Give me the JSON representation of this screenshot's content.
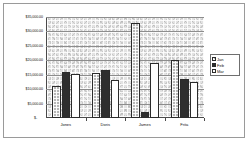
{
  "chart_data": {
    "type": "bar",
    "title": "",
    "xlabel": "",
    "ylabel": "",
    "ylim": [
      0,
      35000
    ],
    "grid": true,
    "legend_position": "right",
    "categories": [
      "Jones",
      "Doris",
      "James",
      "Frita"
    ],
    "ytick_labels": [
      "$35,000.00",
      "$30,000.00",
      "$25,000.00",
      "$20,000.00",
      "$15,000.00",
      "$10,000.00",
      "$5,000.00"
    ],
    "ytick_values": [
      35000,
      30000,
      25000,
      20000,
      15000,
      10000,
      5000
    ],
    "zero_label": "$-",
    "series": [
      {
        "name": "Jan",
        "values": [
          11200,
          15700,
          33000,
          20000
        ]
      },
      {
        "name": "Feb",
        "values": [
          16100,
          16500,
          2200,
          13400
        ]
      },
      {
        "name": "Mar",
        "values": [
          15400,
          13100,
          19000,
          12500
        ]
      }
    ]
  }
}
